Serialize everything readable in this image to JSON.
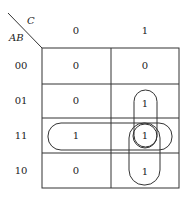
{
  "diagram": {
    "type": "karnaugh-map",
    "row_variable": "AB",
    "column_variable": "C",
    "columns": [
      "0",
      "1"
    ],
    "rows": [
      {
        "label": "00",
        "cells": [
          "0",
          "0"
        ]
      },
      {
        "label": "01",
        "cells": [
          "0",
          "1"
        ]
      },
      {
        "label": "11",
        "cells": [
          "1",
          "1"
        ]
      },
      {
        "label": "10",
        "cells": [
          "0",
          "1"
        ]
      }
    ],
    "groupings": [
      {
        "name": "row-11-pair",
        "cells": [
          [
            2,
            0
          ],
          [
            2,
            1
          ]
        ]
      },
      {
        "name": "col-1-rows-01-11",
        "cells": [
          [
            1,
            1
          ],
          [
            2,
            1
          ]
        ]
      },
      {
        "name": "col-1-rows-11-10",
        "cells": [
          [
            2,
            1
          ],
          [
            3,
            1
          ]
        ]
      },
      {
        "name": "single-11-1",
        "cells": [
          [
            2,
            1
          ]
        ]
      }
    ],
    "colors": {
      "line": "#333333",
      "background": "#ffffff"
    }
  }
}
